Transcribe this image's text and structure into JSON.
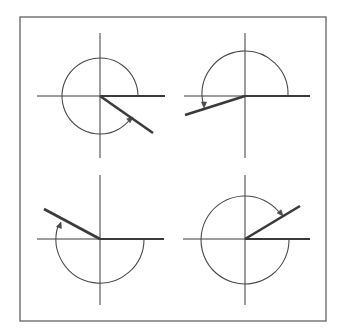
{
  "diagram": {
    "colors": {
      "background": "#ffffff",
      "frame": "#6e6e6e",
      "lines": "#3a3a3a",
      "arc": "#4a4a4a"
    },
    "frame": {
      "x": 20,
      "y": 17,
      "width": 306,
      "height": 304
    },
    "panels": [
      {
        "id": "top-left",
        "center": [
          100,
          96
        ],
        "axis_h": [
          37,
          165
        ],
        "axis_v": [
          33,
          158
        ],
        "radius": 38,
        "terminal_angle_deg": -35,
        "rotation": "counterclockwise",
        "measure_deg": 325,
        "terminal_end": [
          153,
          133
        ],
        "arc_path": "M 138 96 A 38 38 0 1 0 131 118",
        "arrow": {
          "tip": [
            133,
            117
          ],
          "angle_deg": -40
        }
      },
      {
        "id": "top-right",
        "center": [
          245,
          96
        ],
        "axis_h": [
          184,
          310
        ],
        "axis_v": [
          33,
          158
        ],
        "radius": 43,
        "terminal_angle_deg": 195,
        "rotation": "counterclockwise",
        "measure_deg": 195,
        "terminal_end": [
          185,
          115
        ],
        "arc_path": "M 288 96 A 43 43 0 1 0 203 103",
        "arrow": {
          "tip": [
            204,
            108
          ],
          "angle_deg": 90
        }
      },
      {
        "id": "bottom-left",
        "center": [
          100,
          239
        ],
        "axis_h": [
          37,
          164
        ],
        "axis_v": [
          175,
          305
        ],
        "radius": 44,
        "terminal_angle_deg": 150,
        "rotation": "clockwise",
        "measure_deg": -210,
        "terminal_end": [
          44,
          209
        ],
        "arc_path": "M 144 239 A 44 44 0 1 1 58 226",
        "arrow": {
          "tip": [
            61,
            222
          ],
          "angle_deg": -70
        }
      },
      {
        "id": "bottom-right",
        "center": [
          245,
          239
        ],
        "axis_h": [
          183,
          310
        ],
        "axis_v": [
          175,
          305
        ],
        "radius": 44,
        "terminal_angle_deg": 30,
        "rotation": "clockwise",
        "measure_deg": -330,
        "terminal_end": [
          300,
          206
        ],
        "arc_path": "M 289 239 A 44 44 0 1 1 279 212",
        "arrow": {
          "tip": [
            283,
            216
          ],
          "angle_deg": 50
        }
      }
    ]
  }
}
